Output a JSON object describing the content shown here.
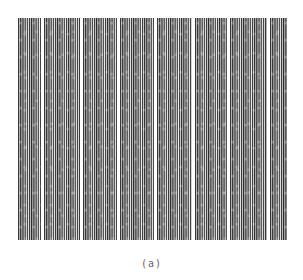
{
  "figure": {
    "caption": "(a)",
    "colors": {
      "stripe_dark": "#2a2a2a",
      "stripe_light": "#f2f2f2",
      "background": "#ffffff",
      "caption": "#666666"
    },
    "blocks": [
      {
        "left": 18,
        "width": 23
      },
      {
        "left": 44,
        "width": 36
      },
      {
        "left": 83,
        "width": 34
      },
      {
        "left": 120,
        "width": 34
      },
      {
        "left": 157,
        "width": 35
      },
      {
        "left": 195,
        "width": 32
      },
      {
        "left": 230,
        "width": 37
      },
      {
        "left": 270,
        "width": 17
      }
    ]
  }
}
